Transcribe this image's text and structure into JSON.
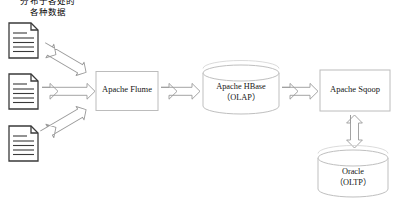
{
  "diagram": {
    "type": "architecture-flow-diagram",
    "background_color": "#ffffff",
    "caption": {
      "line1": "分布于各处的",
      "line2": "各种数据"
    },
    "style": {
      "node_stroke": "#b9b9b9",
      "node_fill": "#ffffff",
      "arrow_stroke": "#9a9a9a",
      "arrow_fill": "#ffffff",
      "document_stroke": "#3a3a3a",
      "text_color": "#141414"
    },
    "sources": [
      {
        "name": "document-1",
        "icon": "document-icon"
      },
      {
        "name": "document-2",
        "icon": "document-icon"
      },
      {
        "name": "document-3",
        "icon": "document-icon"
      }
    ],
    "nodes": {
      "flume": {
        "shape": "rectangle",
        "label": "Apache Flume",
        "sub": ""
      },
      "hbase": {
        "shape": "cylinder",
        "label": "Apache HBase",
        "sub": "（OLAP）"
      },
      "sqoop": {
        "shape": "rectangle",
        "label": "Apache Sqoop",
        "sub": ""
      },
      "oracle": {
        "shape": "cylinder",
        "label": "Oracle",
        "sub": "（OLTP）"
      }
    },
    "connectors": [
      {
        "name": "doc1-to-flume",
        "direction": "bidirectional",
        "orientation": "diagonal-down"
      },
      {
        "name": "doc2-to-flume",
        "direction": "bidirectional",
        "orientation": "horizontal"
      },
      {
        "name": "doc3-to-flume",
        "direction": "bidirectional",
        "orientation": "diagonal-up"
      },
      {
        "name": "flume-to-hbase",
        "direction": "bidirectional",
        "orientation": "horizontal"
      },
      {
        "name": "hbase-to-sqoop",
        "direction": "bidirectional",
        "orientation": "horizontal"
      },
      {
        "name": "sqoop-to-oracle",
        "direction": "bidirectional",
        "orientation": "vertical"
      }
    ]
  }
}
